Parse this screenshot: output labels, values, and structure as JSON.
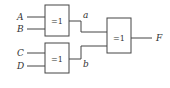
{
  "diagram": {
    "type": "logic-circuit",
    "inputs": [
      {
        "id": "A",
        "label": "A"
      },
      {
        "id": "B",
        "label": "B"
      },
      {
        "id": "C",
        "label": "C"
      },
      {
        "id": "D",
        "label": "D"
      }
    ],
    "gates": [
      {
        "id": "g1",
        "label": "=1",
        "inputs": [
          "A",
          "B"
        ],
        "output": "a"
      },
      {
        "id": "g2",
        "label": "=1",
        "inputs": [
          "C",
          "D"
        ],
        "output": "b"
      },
      {
        "id": "g3",
        "label": "=1",
        "inputs": [
          "a",
          "b"
        ],
        "output": "F"
      }
    ],
    "intermediate": [
      {
        "id": "a",
        "label": "a"
      },
      {
        "id": "b",
        "label": "b"
      }
    ],
    "output": {
      "id": "F",
      "label": "F"
    },
    "colors": {
      "stroke": "#444444",
      "text": "#333333",
      "background": "#ffffff"
    }
  }
}
